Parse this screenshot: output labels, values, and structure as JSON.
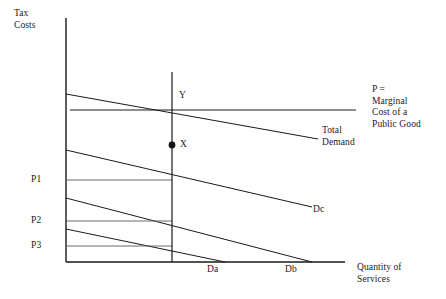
{
  "figure": {
    "background": "#ffffff",
    "line_color": "#1a1a1a",
    "axis_color": "#1a1a1a"
  },
  "axes": {
    "y_label_line1": "Tax",
    "y_label_line2": "Costs",
    "x_label_line1": "Quantity of",
    "x_label_line2": "Services",
    "y_axis_x": 66,
    "y_axis_top": 18,
    "y_axis_bottom": 262,
    "x_axis_left": 66,
    "x_axis_right": 345,
    "x_axis_y": 262
  },
  "price_ticks": [
    {
      "label": "P1",
      "y": 180
    },
    {
      "label": "P2",
      "y": 221
    },
    {
      "label": "P3",
      "y": 246
    }
  ],
  "quantity_ticks": [
    {
      "label": "Da",
      "x": 225
    },
    {
      "label": "Db",
      "x": 312
    }
  ],
  "points": [
    {
      "label": "Y",
      "x": 172,
      "y": 104,
      "filled": false
    },
    {
      "label": "X",
      "x": 172,
      "y": 145,
      "filled": true
    }
  ],
  "curves": [
    {
      "name": "marginal-cost-line",
      "label_line1": "P =",
      "label_line2": "Marginal",
      "label_line3": "Cost of a",
      "label_line4": "Public Good",
      "type": "horizontal",
      "x1": 70,
      "y1": 110,
      "x2": 356,
      "y2": 110
    },
    {
      "name": "total-demand-curve",
      "label_line1": "Total",
      "label_line2": "Demand",
      "type": "sloped",
      "x1": 66,
      "y1": 94,
      "x2": 318,
      "y2": 139
    },
    {
      "name": "demand-curve-dc",
      "label": "Dc",
      "type": "sloped",
      "x1": 66,
      "y1": 150,
      "x2": 312,
      "y2": 207
    },
    {
      "name": "demand-curve-db",
      "type": "sloped",
      "x1": 66,
      "y1": 198,
      "x2": 312,
      "y2": 262
    },
    {
      "name": "demand-curve-da",
      "type": "sloped",
      "x1": 66,
      "y1": 229,
      "x2": 225,
      "y2": 262
    }
  ],
  "price_lines": [
    {
      "name": "price-line-p1",
      "x1": 66,
      "y": 180,
      "x2": 172
    },
    {
      "name": "price-line-p2",
      "x1": 66,
      "y": 221,
      "x2": 172
    },
    {
      "name": "price-line-p3",
      "x1": 66,
      "y": 246,
      "x2": 172
    }
  ],
  "vertical_line": {
    "name": "equilibrium-quantity-line",
    "x": 172,
    "y1": 72,
    "y2": 262
  },
  "labels": {
    "mc_line1": "P =",
    "mc_line2": "Marginal",
    "mc_line3": "Cost of a",
    "mc_line4": "Public Good",
    "total_demand_line1": "Total",
    "total_demand_line2": "Demand",
    "dc": "Dc",
    "point_x": "X",
    "point_y": "Y"
  }
}
